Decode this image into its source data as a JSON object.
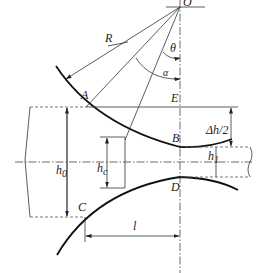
{
  "diagram": {
    "labels": {
      "O": "O",
      "R": "R",
      "theta": "θ",
      "alpha": "α",
      "A": "A",
      "E": "E",
      "B": "B",
      "D": "D",
      "C": "C",
      "delta_h_half": "Δh/2",
      "h0": "h",
      "h0_sub": "0",
      "hc": "h",
      "hc_sub": "c",
      "h1": "h",
      "h1_sub": "1",
      "l": "l"
    },
    "colors": {
      "line": "#333333",
      "roll_contour": "#111111",
      "background": "#ffffff"
    }
  }
}
